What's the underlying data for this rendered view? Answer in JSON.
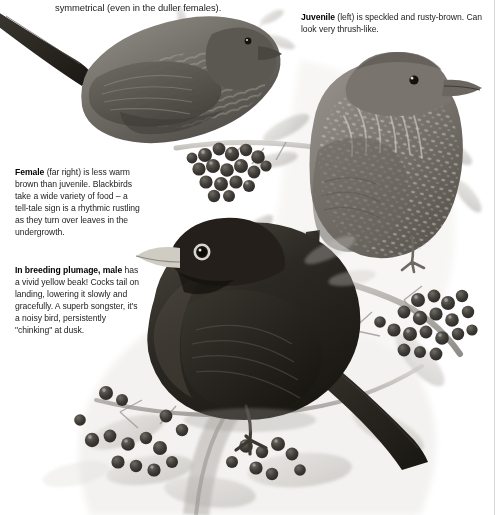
{
  "page": {
    "title": "Blackbird",
    "background_color": "#ffffff",
    "ink_color": "#1c1c1c"
  },
  "intro": {
    "text": "symmetrical (even in the duller females)."
  },
  "captions": {
    "juvenile": {
      "lead": "Juvenile",
      "body": " (left) is speckled and rusty-brown. Can look very thrush-like."
    },
    "female": {
      "lead": "Female",
      "body": " (far right) is less warm brown than juvenile. Blackbirds take a wide variety of food – a tell-tale sign is a rhythmic rustling as they turn over leaves in the undergrowth."
    },
    "male": {
      "lead": "In breeding plumage, male",
      "body": " has a vivid yellow beak! Cocks tail on landing, lowering it slowly and gracefully. A superb songster, it's a noisy bird, persistently \"chinking\" at dusk."
    }
  },
  "illustration": {
    "medium": "grayscale painting",
    "subjects": [
      {
        "name": "female-blackbird",
        "label": "Female blackbird perched on rowan branch",
        "position": "top-left",
        "tone": "#6d6a66"
      },
      {
        "name": "juvenile-blackbird",
        "label": "Juvenile blackbird, speckled breast",
        "position": "upper-right",
        "tone": "#7b7873"
      },
      {
        "name": "male-blackbird",
        "label": "Male blackbird with yellow bill and eye-ring",
        "position": "centre-bottom",
        "tone": "#2a2825"
      }
    ],
    "foliage": {
      "name": "rowan-foliage",
      "label": "Rowan leaves, twigs and berry clusters",
      "berry_clusters": 4,
      "tone": "#b9b6b1"
    },
    "colors": {
      "dark_plumage": "#26241f",
      "mid_plumage": "#6e6a64",
      "light_plumage": "#a8a49d",
      "berry_dark": "#4a4743",
      "foliage_light": "#cfcdc8",
      "beak_light": "#d9d6cf"
    }
  }
}
